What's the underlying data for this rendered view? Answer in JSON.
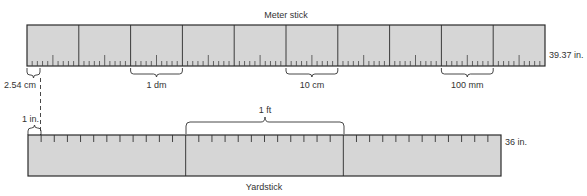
{
  "meter_stick": {
    "title": "Meter stick",
    "length_label": "39.37 in.",
    "sections": 10,
    "ticks_per_section": 10,
    "brackets": [
      {
        "label": "1 dm",
        "section": 2
      },
      {
        "label": "10 cm",
        "section": 5
      },
      {
        "label": "100 mm",
        "section": 8
      }
    ],
    "inch_bracket_label": "2.54 cm"
  },
  "yardstick": {
    "title": "Yardstick",
    "length_label": "36 in.",
    "sections": 3,
    "ticks_per_section": 12,
    "foot_bracket_label": "1 ft",
    "inch_bracket_label": "1 in."
  },
  "colors": {
    "fill": "#d6d6d6",
    "stroke": "#2a2a2a",
    "text": "#333333"
  }
}
